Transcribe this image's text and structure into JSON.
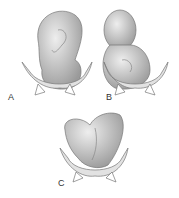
{
  "figure": {
    "panels": [
      {
        "label": "A",
        "description": "Fetus in breech presentation (frank breech) above pelvis"
      },
      {
        "label": "B",
        "description": "Fetus in complete breech presentation above pelvis"
      },
      {
        "label": "C",
        "description": "Fetus in transverse/footling position above pelvis"
      }
    ]
  },
  "colors": {
    "body": "#cfcfcf",
    "shade": "#9a9a9a",
    "pelvis": "#e2e2e2",
    "outline": "#777777"
  }
}
